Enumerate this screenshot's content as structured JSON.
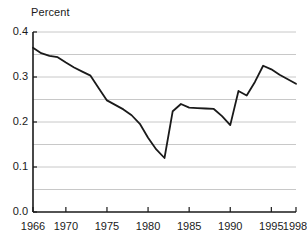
{
  "chart_data": {
    "type": "line",
    "title": "",
    "subtitle": "",
    "xlabel": "",
    "ylabel": "Percent",
    "ylim": [
      0.0,
      0.4
    ],
    "xlim": [
      1966,
      1998
    ],
    "grid": true,
    "grid_axis": "y",
    "grid_interval": 0.05,
    "legend": null,
    "legend_position": "none",
    "y_ticks": [
      0.0,
      0.1,
      0.2,
      0.3,
      0.4
    ],
    "y_tick_labels": [
      "0.0",
      "0.1",
      "0.2",
      "0.3",
      "0.4"
    ],
    "x_ticks": [
      1966,
      1970,
      1975,
      1980,
      1985,
      1990,
      1995,
      1998
    ],
    "x_tick_labels": [
      "1966",
      "1970",
      "1975",
      "1980",
      "1985",
      "1990",
      "1995",
      "1998"
    ],
    "line_color": "#1a1a1a",
    "line_width": 1.8,
    "x": [
      1966,
      1967,
      1968,
      1969,
      1970,
      1971,
      1972,
      1973,
      1974,
      1975,
      1976,
      1977,
      1978,
      1979,
      1980,
      1981,
      1982,
      1983,
      1984,
      1985,
      1986,
      1987,
      1988,
      1989,
      1990,
      1991,
      1992,
      1993,
      1994,
      1995,
      1996,
      1997,
      1998
    ],
    "values": [
      0.365,
      0.353,
      0.347,
      0.344,
      0.332,
      0.321,
      0.312,
      0.303,
      0.275,
      0.248,
      0.238,
      0.228,
      0.215,
      0.196,
      0.165,
      0.139,
      0.12,
      0.224,
      0.24,
      0.232,
      0.231,
      0.23,
      0.229,
      0.213,
      0.193,
      0.269,
      0.259,
      0.289,
      0.325,
      0.317,
      0.305,
      0.295,
      0.285
    ],
    "series": [
      {
        "name": "Percent",
        "values": [
          0.365,
          0.353,
          0.347,
          0.344,
          0.332,
          0.321,
          0.312,
          0.303,
          0.275,
          0.248,
          0.238,
          0.228,
          0.215,
          0.196,
          0.165,
          0.139,
          0.12,
          0.224,
          0.24,
          0.232,
          0.231,
          0.23,
          0.229,
          0.213,
          0.193,
          0.269,
          0.259,
          0.289,
          0.325,
          0.317,
          0.305,
          0.295,
          0.285
        ]
      }
    ],
    "annotations": []
  },
  "axes": {
    "y_axis_title": "Percent",
    "axis_color": "#1a1a1a",
    "gridline_color": "#c8c8c8",
    "background_color": "#ffffff"
  }
}
